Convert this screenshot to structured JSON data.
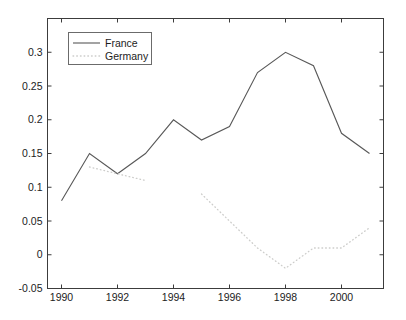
{
  "figure": {
    "background": "#ffffff",
    "axis_color": "#3c3c3c",
    "text_color": "#1c1c1c",
    "legend_border_color": "#6b6b6b",
    "font_size_px": 10.5
  },
  "chart_data": {
    "type": "line",
    "title": "",
    "xlabel": "",
    "ylabel": "",
    "grid": false,
    "x": [
      1990,
      1991,
      1992,
      1993,
      1994,
      1995,
      1996,
      1997,
      1998,
      1999,
      2000,
      2001
    ],
    "series": [
      {
        "name": "France",
        "style": "solid",
        "color": "#585858",
        "values": [
          0.08,
          0.15,
          0.12,
          0.15,
          0.2,
          0.17,
          0.19,
          0.27,
          0.3,
          0.28,
          0.18,
          0.15
        ]
      },
      {
        "name": "Germany",
        "style": "dotted",
        "color": "#cdcdcb",
        "values": [
          null,
          0.13,
          0.12,
          0.11,
          null,
          0.09,
          0.05,
          0.01,
          -0.02,
          0.01,
          0.01,
          0.04
        ]
      }
    ],
    "xlim": [
      1989.5,
      2001.5
    ],
    "ylim": [
      -0.05,
      0.35
    ],
    "xticks": {
      "values": [
        1990,
        1992,
        1994,
        1996,
        1998,
        2000
      ],
      "labels": [
        "1990",
        "1992",
        "1994",
        "1996",
        "1998",
        "2000"
      ]
    },
    "yticks": {
      "values": [
        -0.05,
        0,
        0.05,
        0.1,
        0.15,
        0.2,
        0.25,
        0.3
      ],
      "labels": [
        "-0.05",
        "0",
        "0.05",
        "0.1",
        "0.15",
        "0.2",
        "0.25",
        "0.3"
      ]
    },
    "legend": {
      "position": "top-left",
      "entries": [
        "France",
        "Germany"
      ]
    }
  }
}
